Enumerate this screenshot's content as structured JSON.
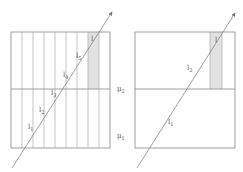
{
  "diagram": {
    "left_panel": {
      "rect": {
        "x": 11,
        "y": 32,
        "w": 99,
        "h": 116
      },
      "divider_y": 89,
      "columns": 9,
      "shaded_column_index": 7,
      "shaded_range": {
        "y_top": 32,
        "y_bottom": 89
      },
      "ray": {
        "x1": 12,
        "y1": 168,
        "x2": 112,
        "y2": 12
      },
      "labels": {
        "l": "l",
        "l5": {
          "base": "l",
          "sub": "5"
        },
        "l4": {
          "base": "l",
          "sub": "4"
        },
        "l3": {
          "base": "l",
          "sub": "3"
        },
        "l2": {
          "base": "l",
          "sub": "2"
        },
        "l1": {
          "base": "l",
          "sub": "1"
        }
      }
    },
    "right_panel": {
      "rect": {
        "x": 135,
        "y": 32,
        "w": 100,
        "h": 116
      },
      "divider_y": 89,
      "shaded_column": {
        "x": 210,
        "w": 12
      },
      "ray": {
        "x1": 137,
        "y1": 168,
        "x2": 235,
        "y2": 13
      },
      "labels": {
        "l": "l",
        "l2": {
          "base": "l",
          "sub": "2"
        },
        "l1": {
          "base": "l",
          "sub": "1"
        }
      }
    },
    "medium_labels": {
      "mu2": {
        "base": "μ",
        "sub": "2"
      },
      "mu1": {
        "base": "μ",
        "sub": "1"
      }
    },
    "colors": {
      "stroke": "#888888",
      "column_stroke": "#aaaaaa",
      "shade": "#e2e2e2",
      "ray": "#777777",
      "text": "#555555"
    }
  }
}
